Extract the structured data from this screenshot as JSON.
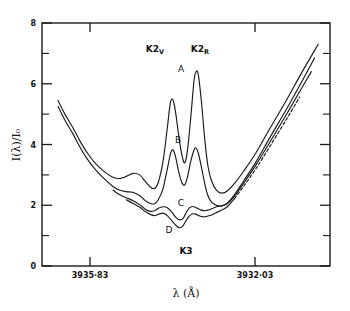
{
  "chart_data": {
    "type": "line",
    "title": "",
    "subtitle": "",
    "xlabel": "λ (Å)",
    "ylabel": "I(λ)/I₀",
    "xlim": [
      3936.63,
      3931.23
    ],
    "ylim": [
      0,
      8
    ],
    "grid": false,
    "legend_position": "none",
    "x_axis_inverted": true,
    "y_ticks_major": [
      "0",
      "2",
      "4",
      "6",
      "8"
    ],
    "y_ticks_major_values": [
      0,
      2,
      4,
      6,
      8
    ],
    "y_ticks_minor_values": [
      1,
      3,
      5,
      7
    ],
    "x_ticks_major": [
      "3935·83",
      "3932·03"
    ],
    "x_ticks_major_values": [
      3935.83,
      3932.03
    ],
    "annotations": [
      {
        "id": "k2v",
        "text": "K2",
        "sub": "V",
        "x_px": 155,
        "y_px": 49
      },
      {
        "id": "k2r",
        "text": "K2",
        "sub": "R",
        "x_px": 199,
        "y_px": 49
      },
      {
        "id": "peak-a",
        "text": "A",
        "x_px": 181,
        "y_px": 70
      },
      {
        "id": "peak-b",
        "text": "B",
        "x_px": 178,
        "y_px": 140
      },
      {
        "id": "peak-c",
        "text": "C",
        "x_px": 181,
        "y_px": 203
      },
      {
        "id": "peak-d",
        "text": "D",
        "x_px": 169,
        "y_px": 230
      },
      {
        "id": "k3",
        "text": "K3",
        "x_px": 186,
        "y_px": 251
      }
    ],
    "series": [
      {
        "name": "A",
        "label": "A",
        "style": "solid",
        "description": "Upper profile with strongest K2V and K2R emission peaks",
        "points": [
          [
            3936.33,
            5.45
          ],
          [
            3936.2,
            5.0
          ],
          [
            3936.05,
            4.55
          ],
          [
            3935.92,
            4.12
          ],
          [
            3935.78,
            3.72
          ],
          [
            3935.62,
            3.36
          ],
          [
            3935.45,
            3.09
          ],
          [
            3935.3,
            2.92
          ],
          [
            3935.18,
            2.88
          ],
          [
            3935.05,
            2.95
          ],
          [
            3934.92,
            3.05
          ],
          [
            3934.8,
            3.0
          ],
          [
            3934.7,
            2.8
          ],
          [
            3934.6,
            2.6
          ],
          [
            3934.52,
            2.55
          ],
          [
            3934.45,
            2.75
          ],
          [
            3934.36,
            3.45
          ],
          [
            3934.28,
            4.55
          ],
          [
            3934.22,
            5.4
          ],
          [
            3934.17,
            5.45
          ],
          [
            3934.12,
            5.0
          ],
          [
            3934.06,
            4.2
          ],
          [
            3934.0,
            3.6
          ],
          [
            3933.95,
            3.4
          ],
          [
            3933.9,
            3.85
          ],
          [
            3933.84,
            4.9
          ],
          [
            3933.78,
            6.1
          ],
          [
            3933.74,
            6.4
          ],
          [
            3933.7,
            6.3
          ],
          [
            3933.64,
            5.4
          ],
          [
            3933.58,
            4.2
          ],
          [
            3933.52,
            3.3
          ],
          [
            3933.45,
            2.8
          ],
          [
            3933.36,
            2.5
          ],
          [
            3933.26,
            2.4
          ],
          [
            3933.15,
            2.48
          ],
          [
            3933.02,
            2.72
          ],
          [
            3932.85,
            3.12
          ],
          [
            3932.62,
            3.72
          ],
          [
            3932.35,
            4.55
          ],
          [
            3932.05,
            5.45
          ],
          [
            3931.75,
            6.4
          ],
          [
            3931.45,
            7.3
          ]
        ]
      },
      {
        "name": "B",
        "label": "B",
        "style": "solid",
        "description": "Middle profile, weaker K2 emission peaks",
        "points": [
          [
            3936.33,
            5.25
          ],
          [
            3936.2,
            4.8
          ],
          [
            3936.05,
            4.35
          ],
          [
            3935.92,
            3.92
          ],
          [
            3935.78,
            3.52
          ],
          [
            3935.62,
            3.16
          ],
          [
            3935.45,
            2.85
          ],
          [
            3935.3,
            2.62
          ],
          [
            3935.18,
            2.5
          ],
          [
            3935.05,
            2.45
          ],
          [
            3934.92,
            2.42
          ],
          [
            3934.8,
            2.32
          ],
          [
            3934.7,
            2.16
          ],
          [
            3934.6,
            2.06
          ],
          [
            3934.52,
            2.05
          ],
          [
            3934.45,
            2.18
          ],
          [
            3934.36,
            2.55
          ],
          [
            3934.28,
            3.2
          ],
          [
            3934.22,
            3.7
          ],
          [
            3934.17,
            3.82
          ],
          [
            3934.12,
            3.55
          ],
          [
            3934.06,
            3.05
          ],
          [
            3934.0,
            2.72
          ],
          [
            3933.95,
            2.68
          ],
          [
            3933.9,
            2.95
          ],
          [
            3933.84,
            3.45
          ],
          [
            3933.78,
            3.82
          ],
          [
            3933.74,
            3.88
          ],
          [
            3933.7,
            3.72
          ],
          [
            3933.64,
            3.25
          ],
          [
            3933.58,
            2.72
          ],
          [
            3933.52,
            2.32
          ],
          [
            3933.45,
            2.1
          ],
          [
            3933.36,
            2.0
          ],
          [
            3933.26,
            1.98
          ],
          [
            3933.15,
            2.08
          ],
          [
            3933.02,
            2.35
          ],
          [
            3932.85,
            2.8
          ],
          [
            3932.62,
            3.42
          ],
          [
            3932.35,
            4.25
          ],
          [
            3932.05,
            5.15
          ],
          [
            3931.75,
            6.1
          ],
          [
            3931.52,
            6.85
          ]
        ]
      },
      {
        "name": "C",
        "label": "C",
        "style": "solid",
        "description": "Lower profile with shallow central reversal near K3",
        "points": [
          [
            3935.3,
            2.5
          ],
          [
            3935.18,
            2.35
          ],
          [
            3935.05,
            2.25
          ],
          [
            3934.92,
            2.15
          ],
          [
            3934.8,
            2.02
          ],
          [
            3934.7,
            1.88
          ],
          [
            3934.6,
            1.8
          ],
          [
            3934.52,
            1.82
          ],
          [
            3934.45,
            1.9
          ],
          [
            3934.36,
            1.95
          ],
          [
            3934.28,
            1.92
          ],
          [
            3934.2,
            1.78
          ],
          [
            3934.12,
            1.6
          ],
          [
            3934.05,
            1.52
          ],
          [
            3933.98,
            1.58
          ],
          [
            3933.92,
            1.78
          ],
          [
            3933.86,
            1.92
          ],
          [
            3933.8,
            1.96
          ],
          [
            3933.74,
            1.92
          ],
          [
            3933.66,
            1.85
          ],
          [
            3933.58,
            1.82
          ],
          [
            3933.48,
            1.86
          ],
          [
            3933.36,
            1.95
          ],
          [
            3933.26,
            1.98
          ],
          [
            3933.15,
            2.06
          ],
          [
            3933.02,
            2.3
          ],
          [
            3932.85,
            2.72
          ],
          [
            3932.62,
            3.32
          ],
          [
            3932.35,
            4.1
          ],
          [
            3932.05,
            4.98
          ],
          [
            3931.78,
            5.8
          ],
          [
            3931.58,
            6.4
          ]
        ]
      },
      {
        "name": "D",
        "label": "D",
        "style": "dashed-segment",
        "description": "Lowest profile; dashed over outer wings, solid near core",
        "points": [
          [
            3935.05,
            2.18
          ],
          [
            3934.92,
            2.06
          ],
          [
            3934.8,
            1.94
          ],
          [
            3934.7,
            1.8
          ],
          [
            3934.6,
            1.7
          ],
          [
            3934.52,
            1.66
          ],
          [
            3934.45,
            1.7
          ],
          [
            3934.36,
            1.74
          ],
          [
            3934.28,
            1.66
          ],
          [
            3934.2,
            1.5
          ],
          [
            3934.12,
            1.34
          ],
          [
            3934.05,
            1.26
          ],
          [
            3933.98,
            1.34
          ],
          [
            3933.92,
            1.52
          ],
          [
            3933.86,
            1.66
          ],
          [
            3933.8,
            1.72
          ],
          [
            3933.74,
            1.7
          ],
          [
            3933.66,
            1.64
          ],
          [
            3933.58,
            1.62
          ],
          [
            3933.48,
            1.66
          ],
          [
            3933.36,
            1.76
          ],
          [
            3933.26,
            1.84
          ],
          [
            3933.15,
            1.96
          ],
          [
            3933.02,
            2.22
          ],
          [
            3932.85,
            2.62
          ],
          [
            3932.62,
            3.2
          ],
          [
            3932.35,
            3.96
          ],
          [
            3932.05,
            4.82
          ],
          [
            3931.8,
            5.56
          ]
        ]
      }
    ]
  },
  "axes": {
    "y_label": "I(λ)/I₀",
    "x_label": "λ (Å)",
    "y_tick_0": "0",
    "y_tick_2": "2",
    "y_tick_4": "4",
    "y_tick_6": "6",
    "y_tick_8": "8",
    "x_tick_left": "3935·83",
    "x_tick_right": "3932·03"
  },
  "labels": {
    "k2v_main": "K2",
    "k2v_sub": "V",
    "k2r_main": "K2",
    "k2r_sub": "R",
    "a": "A",
    "b": "B",
    "c": "C",
    "d": "D",
    "k3": "K3"
  },
  "colors": {
    "ink": "#1a1a1a",
    "background": "#ffffff"
  }
}
